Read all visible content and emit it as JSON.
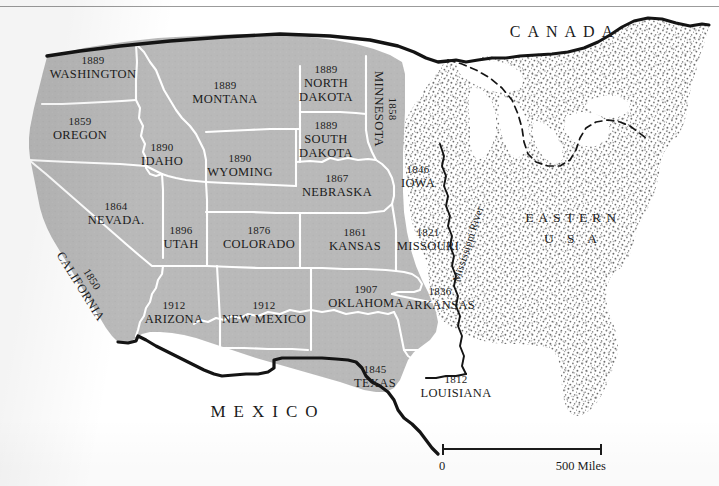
{
  "map": {
    "title": "Western United States — Year of Statehood",
    "colors": {
      "west_fill": "#b9b9b9",
      "east_stipple_dot": "#6e6e6e",
      "state_border": "#ffffff",
      "national_border": "#141414",
      "background": "#ffffff",
      "text": "#1b1b1b"
    },
    "regions": [
      {
        "name": "canada",
        "label": "CANADA",
        "x": 565,
        "y": 32
      },
      {
        "name": "mexico",
        "label": "MEXICO",
        "x": 268,
        "y": 412
      },
      {
        "name": "eastern",
        "line1": "EASTERN",
        "line2": "U S A",
        "x": 573,
        "y": 229
      }
    ],
    "river": {
      "label": "Mississippi River",
      "x": 468,
      "y": 244
    },
    "states": [
      {
        "id": "washington",
        "year": "1889",
        "name": "WASHINGTON",
        "x": 93,
        "y": 68
      },
      {
        "id": "oregon",
        "year": "1859",
        "name": "OREGON",
        "x": 80,
        "y": 129
      },
      {
        "id": "idaho",
        "year": "1890",
        "name": "IDAHO",
        "x": 162,
        "y": 155
      },
      {
        "id": "montana",
        "year": "1889",
        "name": "MONTANA",
        "x": 225,
        "y": 93
      },
      {
        "id": "wyoming",
        "year": "1890",
        "name": "WYOMING",
        "x": 240,
        "y": 166
      },
      {
        "id": "north-dakota",
        "year": "1889",
        "name": "NORTH",
        "name2": "DAKOTA",
        "x": 326,
        "y": 84
      },
      {
        "id": "south-dakota",
        "year": "1889",
        "name": "SOUTH",
        "name2": "DAKOTA",
        "x": 326,
        "y": 140
      },
      {
        "id": "nebraska",
        "year": "1867",
        "name": "NEBRASKA",
        "x": 337,
        "y": 186
      },
      {
        "id": "minnesota",
        "year": "1858",
        "name": "MINNESOTA",
        "x": 385,
        "y": 109
      },
      {
        "id": "iowa",
        "year": "1846",
        "name": "IOWA",
        "x": 418,
        "y": 177
      },
      {
        "id": "nevada",
        "year": "1864",
        "name": "NEVADA.",
        "x": 116,
        "y": 214
      },
      {
        "id": "utah",
        "year": "1896",
        "name": "UTAH",
        "x": 181,
        "y": 238
      },
      {
        "id": "colorado",
        "year": "1876",
        "name": "COLORADO",
        "x": 259,
        "y": 238
      },
      {
        "id": "kansas",
        "year": "1861",
        "name": "KANSAS",
        "x": 355,
        "y": 240
      },
      {
        "id": "missouri",
        "year": "1821",
        "name": "MISSOURI",
        "x": 428,
        "y": 240
      },
      {
        "id": "california",
        "year": "1850",
        "name": "CALIFORNIA",
        "x": 86,
        "y": 283
      },
      {
        "id": "arizona",
        "year": "1912",
        "name": "ARIZONA",
        "x": 174,
        "y": 313
      },
      {
        "id": "new-mexico",
        "year": "1912",
        "name": "NEW MEXICO",
        "x": 264,
        "y": 313
      },
      {
        "id": "oklahoma",
        "year": "1907",
        "name": "OKLAHOMA",
        "x": 366,
        "y": 297
      },
      {
        "id": "arkansas",
        "year": "1836",
        "name": "ARKANSAS",
        "x": 440,
        "y": 299
      },
      {
        "id": "texas",
        "year": "1845",
        "name": "TEXAS",
        "x": 375,
        "y": 377
      },
      {
        "id": "louisiana",
        "year": "1812",
        "name": "LOUISIANA",
        "x": 456,
        "y": 387
      }
    ],
    "scale": {
      "start": "0",
      "end": "500 Miles"
    }
  }
}
